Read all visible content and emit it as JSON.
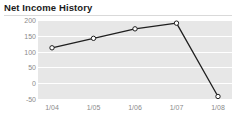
{
  "widget": {
    "title": "Net Income History",
    "background_color": "#ffffff"
  },
  "chart_data": {
    "type": "line",
    "title": "Net Income History",
    "xlabel": "",
    "ylabel": "",
    "categories": [
      "1/04",
      "1/05",
      "1/06",
      "1/07",
      "1/08"
    ],
    "values": [
      112,
      142,
      172,
      190,
      -42
    ],
    "series": [
      {
        "name": "Net Income",
        "values": [
          112,
          142,
          172,
          190,
          -42
        ]
      }
    ],
    "ylim": [
      -50,
      200
    ],
    "yticks": [
      200,
      150,
      100,
      50,
      0,
      -50
    ],
    "ytick_labels": [
      "200",
      "150",
      "100",
      "50",
      "0",
      "-50"
    ],
    "xtick_labels": [
      "1/04",
      "1/05",
      "1/06",
      "1/07",
      "1/08"
    ],
    "grid": true,
    "grid_orientation": "horizontal",
    "grid_color": "#ffffff",
    "plot_background": "#e7e7e7",
    "line_color": "#1f1f1f",
    "marker_style": "circle",
    "marker_fill": "#ffffff",
    "marker_edge_color": "#1f1f1f",
    "legend": false,
    "legend_position": "none"
  }
}
